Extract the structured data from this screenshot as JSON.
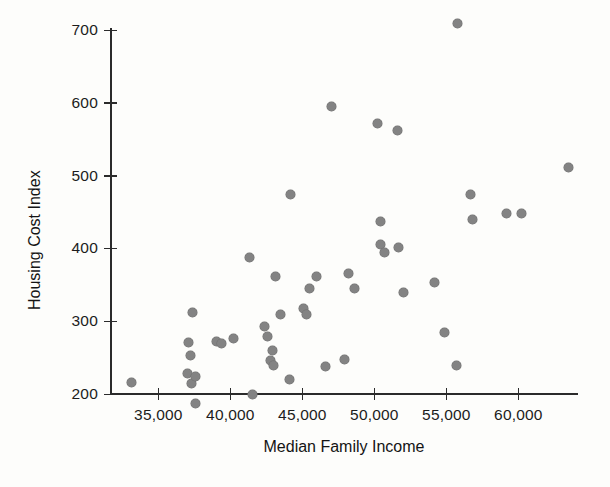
{
  "chart_data": {
    "type": "scatter",
    "title": "",
    "xlabel": "Median Family Income",
    "ylabel": "Housing Cost Index",
    "xlim": [
      32000,
      64500
    ],
    "ylim": [
      180,
      730
    ],
    "xticks": [
      35000,
      40000,
      45000,
      50000,
      55000,
      60000
    ],
    "xtick_labels": [
      "35,000",
      "40,000",
      "45,000",
      "50,000",
      "55,000",
      "60,000"
    ],
    "yticks": [
      200,
      300,
      400,
      500,
      600,
      700
    ],
    "ytick_labels": [
      "200",
      "300",
      "400",
      "500",
      "600",
      "700"
    ],
    "grid": false,
    "legend": null,
    "marker_color": "#838383",
    "axis_color": "#2b2b2b",
    "background": "#fdfdfb",
    "points": [
      {
        "x": 33100,
        "y": 216
      },
      {
        "x": 37100,
        "y": 271
      },
      {
        "x": 37200,
        "y": 253
      },
      {
        "x": 37000,
        "y": 228
      },
      {
        "x": 37350,
        "y": 313
      },
      {
        "x": 37300,
        "y": 215
      },
      {
        "x": 37550,
        "y": 225
      },
      {
        "x": 37600,
        "y": 188
      },
      {
        "x": 39000,
        "y": 272
      },
      {
        "x": 39400,
        "y": 270
      },
      {
        "x": 40200,
        "y": 277
      },
      {
        "x": 41500,
        "y": 200
      },
      {
        "x": 41300,
        "y": 388
      },
      {
        "x": 42400,
        "y": 293
      },
      {
        "x": 42600,
        "y": 280
      },
      {
        "x": 42900,
        "y": 260
      },
      {
        "x": 42800,
        "y": 247
      },
      {
        "x": 43000,
        "y": 240
      },
      {
        "x": 43100,
        "y": 362
      },
      {
        "x": 43500,
        "y": 310
      },
      {
        "x": 44100,
        "y": 221
      },
      {
        "x": 44200,
        "y": 475
      },
      {
        "x": 45100,
        "y": 318
      },
      {
        "x": 45300,
        "y": 309
      },
      {
        "x": 45500,
        "y": 345
      },
      {
        "x": 46000,
        "y": 362
      },
      {
        "x": 46600,
        "y": 238
      },
      {
        "x": 47000,
        "y": 596
      },
      {
        "x": 47900,
        "y": 248
      },
      {
        "x": 48200,
        "y": 366
      },
      {
        "x": 48600,
        "y": 345
      },
      {
        "x": 50200,
        "y": 572
      },
      {
        "x": 50400,
        "y": 437
      },
      {
        "x": 50400,
        "y": 406
      },
      {
        "x": 50700,
        "y": 395
      },
      {
        "x": 51600,
        "y": 563
      },
      {
        "x": 51700,
        "y": 402
      },
      {
        "x": 52000,
        "y": 340
      },
      {
        "x": 54200,
        "y": 353
      },
      {
        "x": 54900,
        "y": 285
      },
      {
        "x": 55700,
        "y": 240
      },
      {
        "x": 55800,
        "y": 710
      },
      {
        "x": 56700,
        "y": 474
      },
      {
        "x": 56800,
        "y": 440
      },
      {
        "x": 59200,
        "y": 448
      },
      {
        "x": 60200,
        "y": 448
      },
      {
        "x": 63500,
        "y": 512
      }
    ]
  }
}
